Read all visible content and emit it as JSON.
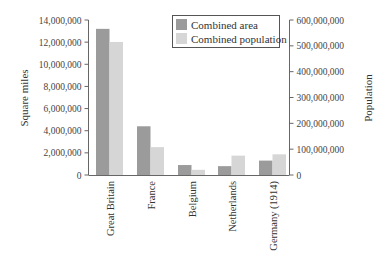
{
  "chart_data": {
    "type": "bar",
    "title": "",
    "categories": [
      "Great Britain",
      "France",
      "Belgium",
      "Netherlands",
      "Germany (1914)"
    ],
    "series": [
      {
        "name": "Combined area",
        "axis": "left",
        "color": "#9b9b9b",
        "values": [
          13200000,
          4400000,
          900000,
          800000,
          1300000
        ]
      },
      {
        "name": "Combined population",
        "axis": "right",
        "color": "#d6d6d6",
        "values": [
          515000000,
          108000000,
          20000000,
          75000000,
          80000000
        ]
      }
    ],
    "ylabel": "Square miles",
    "ylabel_right": "Population",
    "ylim": [
      0,
      14000000
    ],
    "ylim_right": [
      0,
      600000000
    ],
    "yticks": [
      "0",
      "2,000,000",
      "4,000,000",
      "6,000,000",
      "8,000,000",
      "10,000,000",
      "12,000,000",
      "14,000,000"
    ],
    "yticks_right": [
      "0",
      "100,000,000",
      "200,000,000",
      "300,000,000",
      "400,000,000",
      "500,000,000",
      "600,000,000"
    ],
    "legend_position": "upper right inside",
    "grid": false
  },
  "legend": {
    "area_label": "Combined area",
    "population_label": "Combined population"
  },
  "axes": {
    "left_title": "Square miles",
    "right_title": "Population"
  }
}
